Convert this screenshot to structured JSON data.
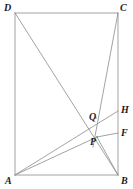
{
  "figure": {
    "type": "geometry-diagram",
    "width": 133,
    "height": 189,
    "background_color": "#ffffff",
    "stroke_color": "#8c8c8c",
    "label_color": "#1a1a1a",
    "stroke_width": 0.8,
    "points": [
      {
        "id": "A",
        "label": "A",
        "x": 15,
        "y": 175,
        "label_x": 5,
        "label_y": 176,
        "kind": "vertex"
      },
      {
        "id": "B",
        "label": "B",
        "x": 118,
        "y": 175,
        "label_x": 121,
        "label_y": 176,
        "kind": "vertex"
      },
      {
        "id": "C",
        "label": "C",
        "x": 118,
        "y": 13,
        "label_x": 120,
        "label_y": 3,
        "kind": "vertex"
      },
      {
        "id": "D",
        "label": "D",
        "x": 15,
        "y": 13,
        "label_x": 4,
        "label_y": 3,
        "kind": "vertex"
      },
      {
        "id": "Q",
        "label": "Q",
        "x": 96,
        "y": 118,
        "label_x": 89,
        "label_y": 112,
        "kind": "intersection"
      },
      {
        "id": "P",
        "label": "P",
        "x": 97,
        "y": 137,
        "label_x": 90,
        "label_y": 137,
        "kind": "intersection"
      },
      {
        "id": "H",
        "label": "H",
        "x": 118,
        "y": 111,
        "label_x": 121,
        "label_y": 105,
        "kind": "exterior"
      },
      {
        "id": "F",
        "label": "F",
        "x": 118,
        "y": 133,
        "label_x": 121,
        "label_y": 128,
        "kind": "exterior"
      }
    ],
    "segments": [
      {
        "id": "side-AB",
        "from": "A",
        "to": "B",
        "x1": 15,
        "y1": 175,
        "x2": 118,
        "y2": 175
      },
      {
        "id": "side-BC",
        "from": "B",
        "to": "C",
        "x1": 118,
        "y1": 175,
        "x2": 118,
        "y2": 13
      },
      {
        "id": "side-CD",
        "from": "C",
        "to": "D",
        "x1": 118,
        "y1": 13,
        "x2": 15,
        "y2": 13
      },
      {
        "id": "side-DA",
        "from": "D",
        "to": "A",
        "x1": 15,
        "y1": 13,
        "x2": 15,
        "y2": 175
      },
      {
        "id": "cevian-D-to-B",
        "from": "D",
        "to": "B",
        "x1": 15,
        "y1": 13,
        "x2": 118,
        "y2": 175
      },
      {
        "id": "cevian-C-to-A",
        "from": "C",
        "to": "A",
        "x1": 118,
        "y1": 13,
        "x2": 93,
        "y2": 147
      },
      {
        "id": "ray-A-to-H",
        "from": "A",
        "to": "H",
        "x1": 15,
        "y1": 175,
        "x2": 118,
        "y2": 111
      },
      {
        "id": "ray-A-to-P",
        "from": "A",
        "to": "P",
        "x1": 15,
        "y1": 175,
        "x2": 97,
        "y2": 137
      },
      {
        "id": "segment-P-to-F",
        "from": "P",
        "to": "F",
        "x1": 97,
        "y1": 137,
        "x2": 118,
        "y2": 133
      },
      {
        "id": "segment-P-to-B",
        "from": "P",
        "to": "B",
        "x1": 97,
        "y1": 137,
        "x2": 118,
        "y2": 175
      }
    ]
  }
}
